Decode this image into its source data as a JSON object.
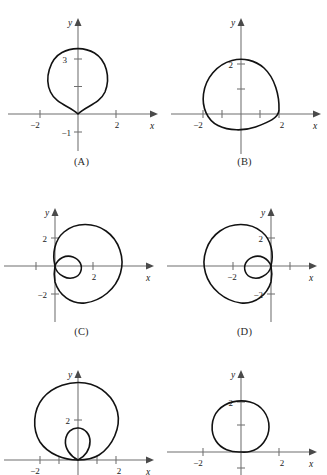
{
  "figure": {
    "type": "multi-panel-polar-curve-figure",
    "background": "#ffffff",
    "curve_color": "#121212",
    "axis_color": "#6f6f6f",
    "panel_count": 6,
    "columns": 2,
    "rows": 3
  },
  "axis_labels": {
    "x": "x",
    "y": "y"
  },
  "panels": [
    {
      "id": "A",
      "caption": "(A)",
      "curve": {
        "type": "cardioid",
        "equation_form": "r = a(1 + sin t)",
        "a": 1.5,
        "orientation": "cusp-down",
        "loop": false
      },
      "xticks": [
        {
          "value": -2,
          "label": "−2"
        },
        {
          "value": 2,
          "label": "2"
        }
      ],
      "yticks": [
        {
          "value": 3,
          "label": "3"
        },
        {
          "value": 1.5,
          "label": ""
        },
        {
          "value": -1,
          "label": "−1"
        }
      ],
      "xrange": [
        -2.7,
        2.7
      ],
      "yrange": [
        -1.6,
        3.6
      ]
    },
    {
      "id": "B",
      "caption": "(B)",
      "curve": {
        "type": "limacon-convex",
        "equation_form": "r = a + b sin t",
        "a": 1.75,
        "b": 1.25,
        "orientation": "up",
        "loop": false
      },
      "xticks": [
        {
          "value": -2,
          "label": "−2"
        },
        {
          "value": -1,
          "label": ""
        },
        {
          "value": 1,
          "label": ""
        },
        {
          "value": 2,
          "label": "2"
        }
      ],
      "yticks": [
        {
          "value": 2,
          "label": "2"
        },
        {
          "value": 1,
          "label": ""
        }
      ],
      "xrange": [
        -2.7,
        2.7
      ],
      "yrange": [
        -1.2,
        3.6
      ]
    },
    {
      "id": "C",
      "caption": "(C)",
      "curve": {
        "type": "limacon-inner-loop",
        "equation_form": "r = a + b cos t",
        "a": 1,
        "b": 2,
        "orientation": "right",
        "loop": true
      },
      "xticks": [
        {
          "value": -2,
          "label": ""
        },
        {
          "value": 2,
          "label": "2"
        }
      ],
      "yticks": [
        {
          "value": 2,
          "label": "2"
        },
        {
          "value": -2,
          "label": "−2"
        }
      ],
      "xrange": [
        -2.8,
        3.6
      ],
      "yrange": [
        -2.9,
        2.9
      ]
    },
    {
      "id": "D",
      "caption": "(D)",
      "curve": {
        "type": "limacon-inner-loop",
        "equation_form": "r = a − b cos t",
        "a": 1,
        "b": 2,
        "orientation": "left",
        "loop": true
      },
      "xticks": [
        {
          "value": -2,
          "label": "−2"
        },
        {
          "value": 2,
          "label": ""
        }
      ],
      "yticks": [
        {
          "value": 2,
          "label": "2"
        },
        {
          "value": -2,
          "label": "−2"
        }
      ],
      "xrange": [
        -3.6,
        2.8
      ],
      "yrange": [
        -2.9,
        2.9
      ]
    },
    {
      "id": "E",
      "caption": "(E)",
      "curve": {
        "type": "limacon-inner-loop",
        "equation_form": "r = a + b sin t",
        "a": 1,
        "b": 2,
        "orientation": "up",
        "loop": true
      },
      "xticks": [
        {
          "value": -2,
          "label": "−2"
        },
        {
          "value": -1,
          "label": ""
        },
        {
          "value": 1,
          "label": ""
        },
        {
          "value": 2,
          "label": "2"
        }
      ],
      "yticks": [
        {
          "value": 2,
          "label": "2"
        }
      ],
      "xrange": [
        -2.8,
        2.8
      ],
      "yrange": [
        -0.6,
        3.4
      ]
    },
    {
      "id": "F",
      "caption": "(F)",
      "curve": {
        "type": "limacon-convex",
        "equation_form": "r = a + b sin t",
        "a": 1.35,
        "b": 0.85,
        "orientation": "up",
        "loop": false
      },
      "xticks": [
        {
          "value": -2,
          "label": "−2"
        },
        {
          "value": 2,
          "label": "2"
        }
      ],
      "yticks": [
        {
          "value": 2,
          "label": "2"
        },
        {
          "value": 1,
          "label": ""
        },
        {
          "value": -1,
          "label": ""
        }
      ],
      "xrange": [
        -2.8,
        2.8
      ],
      "yrange": [
        -1.2,
        3.0
      ]
    }
  ]
}
